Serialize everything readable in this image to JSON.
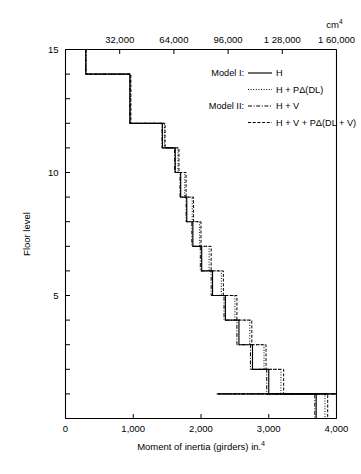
{
  "chart_data": {
    "type": "line",
    "title": "",
    "xlabel": "Moment of inertia (girders) in.⁴",
    "ylabel": "Floor level",
    "top_axis_label": "cm⁴",
    "xlim": [
      0,
      4000
    ],
    "ylim": [
      0,
      15
    ],
    "grid": false,
    "orientation": "step-horizontal",
    "x_ticks": [
      0,
      1000,
      2000,
      3000,
      4000
    ],
    "x_tick_labels": [
      "0",
      "1,000",
      "2,000",
      "3,000",
      "4,000"
    ],
    "y_ticks": [
      0,
      1,
      2,
      3,
      4,
      5,
      6,
      7,
      8,
      9,
      10,
      11,
      12,
      13,
      14,
      15
    ],
    "y_tick_labels": {
      "5": "5",
      "10": "10",
      "15": "15"
    },
    "top_ticks": [
      32000,
      64000,
      96000,
      128000,
      160000
    ],
    "top_tick_labels": [
      "32,000",
      "64,000",
      "96,000",
      "1 28,000",
      "1 60,000"
    ],
    "legend_position": "upper-right-inside",
    "legend_groups": [
      {
        "group": "Model I:",
        "entries": [
          {
            "name": "H",
            "style": "solid"
          },
          {
            "name": "H + PΔ(DL)",
            "style": "dotted"
          }
        ]
      },
      {
        "group": "Model II:",
        "entries": [
          {
            "name": "H + V",
            "style": "dashdot"
          },
          {
            "name": "H + V + PΔ(DL + V)",
            "style": "dashed"
          }
        ]
      }
    ],
    "floors": [
      15,
      14,
      13,
      12,
      11,
      10,
      9,
      8,
      7,
      6,
      5,
      4,
      3,
      2,
      1
    ],
    "series": [
      {
        "name": "H",
        "style": "solid",
        "values": [
          300,
          950,
          950,
          1430,
          1620,
          1700,
          1790,
          1880,
          2010,
          2170,
          2360,
          2560,
          2760,
          3000,
          3700,
          2250
        ]
      },
      {
        "name": "H + PΔ(DL)",
        "style": "dotted",
        "values": [
          300,
          960,
          960,
          1460,
          1660,
          1760,
          1870,
          1980,
          2120,
          2300,
          2500,
          2720,
          2930,
          3180,
          3830,
          2250
        ]
      },
      {
        "name": "H + V",
        "style": "dashdot",
        "values": [
          300,
          950,
          950,
          1425,
          1610,
          1690,
          1780,
          1865,
          1990,
          2150,
          2340,
          2530,
          2730,
          2970,
          3680,
          2230
        ]
      },
      {
        "name": "H + V + PΔ(DL + V)",
        "style": "dashed",
        "values": [
          300,
          965,
          965,
          1470,
          1675,
          1780,
          1890,
          2000,
          2150,
          2330,
          2530,
          2750,
          2960,
          3220,
          3870,
          2260
        ]
      }
    ]
  }
}
